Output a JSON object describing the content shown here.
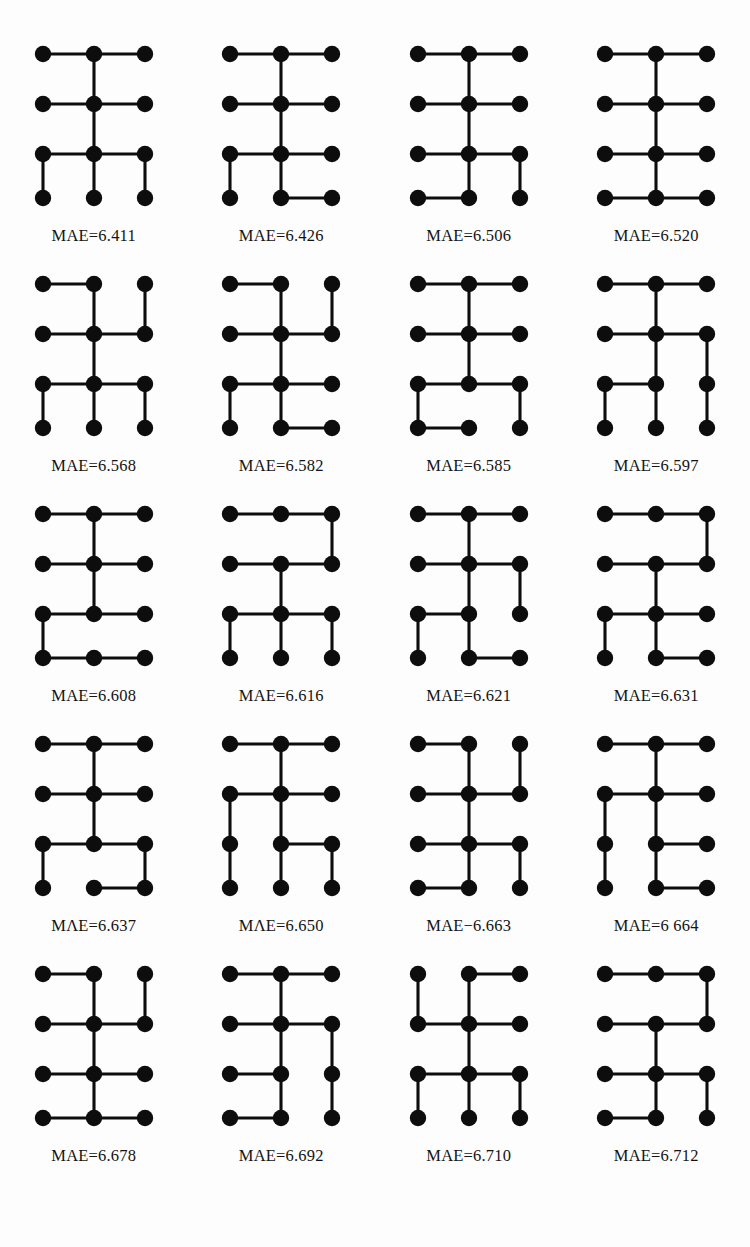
{
  "figure": {
    "node_color": "#0d0d0d",
    "edge_color": "#0d0d0d",
    "background": "#fdfdfd",
    "columns": 4,
    "rows": 5,
    "lattice": {
      "cols": 3,
      "rows": 4
    }
  },
  "graphs": [
    {
      "index": 1,
      "caption": "MAE=6.411",
      "mae": 6.411,
      "h_edges": [
        [
          1,
          1
        ],
        [
          1,
          2
        ],
        [
          2,
          1
        ],
        [
          2,
          2
        ],
        [
          3,
          1
        ],
        [
          3,
          2
        ]
      ],
      "v_edges": [
        [
          1,
          2
        ],
        [
          2,
          2
        ],
        [
          3,
          1
        ],
        [
          3,
          2
        ],
        [
          3,
          3
        ]
      ]
    },
    {
      "index": 2,
      "caption": "MAE=6.426",
      "mae": 6.426,
      "h_edges": [
        [
          1,
          1
        ],
        [
          1,
          2
        ],
        [
          2,
          1
        ],
        [
          2,
          2
        ],
        [
          3,
          1
        ],
        [
          3,
          2
        ],
        [
          4,
          2
        ]
      ],
      "v_edges": [
        [
          1,
          2
        ],
        [
          2,
          2
        ],
        [
          3,
          1
        ],
        [
          3,
          2
        ]
      ]
    },
    {
      "index": 3,
      "caption": "MAE=6.506",
      "mae": 6.506,
      "h_edges": [
        [
          1,
          1
        ],
        [
          1,
          2
        ],
        [
          2,
          1
        ],
        [
          2,
          2
        ],
        [
          3,
          1
        ],
        [
          3,
          2
        ],
        [
          4,
          1
        ]
      ],
      "v_edges": [
        [
          1,
          2
        ],
        [
          2,
          2
        ],
        [
          3,
          2
        ],
        [
          3,
          3
        ]
      ]
    },
    {
      "index": 4,
      "caption": "MAE=6.520",
      "mae": 6.52,
      "h_edges": [
        [
          1,
          1
        ],
        [
          1,
          2
        ],
        [
          2,
          1
        ],
        [
          2,
          2
        ],
        [
          3,
          1
        ],
        [
          3,
          2
        ],
        [
          4,
          1
        ],
        [
          4,
          2
        ]
      ],
      "v_edges": [
        [
          1,
          2
        ],
        [
          2,
          2
        ],
        [
          3,
          2
        ]
      ]
    },
    {
      "index": 5,
      "caption": "MAE=6.568",
      "mae": 6.568,
      "h_edges": [
        [
          1,
          1
        ],
        [
          2,
          1
        ],
        [
          2,
          2
        ],
        [
          3,
          1
        ],
        [
          3,
          2
        ]
      ],
      "v_edges": [
        [
          1,
          2
        ],
        [
          1,
          3
        ],
        [
          2,
          2
        ],
        [
          3,
          1
        ],
        [
          3,
          2
        ],
        [
          3,
          3
        ]
      ]
    },
    {
      "index": 6,
      "caption": "MAE=6.582",
      "mae": 6.582,
      "h_edges": [
        [
          1,
          1
        ],
        [
          2,
          1
        ],
        [
          2,
          2
        ],
        [
          3,
          1
        ],
        [
          3,
          2
        ],
        [
          4,
          2
        ]
      ],
      "v_edges": [
        [
          1,
          2
        ],
        [
          1,
          3
        ],
        [
          2,
          2
        ],
        [
          3,
          1
        ],
        [
          3,
          2
        ]
      ]
    },
    {
      "index": 7,
      "caption": "MAE=6.585",
      "mae": 6.585,
      "h_edges": [
        [
          1,
          1
        ],
        [
          1,
          2
        ],
        [
          2,
          1
        ],
        [
          2,
          2
        ],
        [
          3,
          1
        ],
        [
          3,
          2
        ],
        [
          4,
          1
        ]
      ],
      "v_edges": [
        [
          1,
          2
        ],
        [
          2,
          2
        ],
        [
          3,
          1
        ],
        [
          3,
          3
        ]
      ]
    },
    {
      "index": 8,
      "caption": "MAE=6.597",
      "mae": 6.597,
      "h_edges": [
        [
          1,
          1
        ],
        [
          1,
          2
        ],
        [
          2,
          1
        ],
        [
          2,
          2
        ],
        [
          3,
          1
        ]
      ],
      "v_edges": [
        [
          1,
          2
        ],
        [
          2,
          2
        ],
        [
          2,
          3
        ],
        [
          3,
          1
        ],
        [
          3,
          2
        ],
        [
          3,
          3
        ]
      ]
    },
    {
      "index": 9,
      "caption": "MAE=6.608",
      "mae": 6.608,
      "h_edges": [
        [
          1,
          1
        ],
        [
          1,
          2
        ],
        [
          2,
          1
        ],
        [
          2,
          2
        ],
        [
          3,
          1
        ],
        [
          3,
          2
        ],
        [
          4,
          1
        ],
        [
          4,
          2
        ]
      ],
      "v_edges": [
        [
          1,
          2
        ],
        [
          2,
          2
        ],
        [
          3,
          1
        ]
      ]
    },
    {
      "index": 10,
      "caption": "MAE=6.616",
      "mae": 6.616,
      "h_edges": [
        [
          1,
          1
        ],
        [
          1,
          2
        ],
        [
          2,
          1
        ],
        [
          2,
          2
        ],
        [
          3,
          1
        ],
        [
          3,
          2
        ]
      ],
      "v_edges": [
        [
          1,
          3
        ],
        [
          2,
          2
        ],
        [
          3,
          1
        ],
        [
          3,
          2
        ],
        [
          3,
          3
        ]
      ]
    },
    {
      "index": 11,
      "caption": "MAE=6.621",
      "mae": 6.621,
      "h_edges": [
        [
          1,
          1
        ],
        [
          1,
          2
        ],
        [
          2,
          1
        ],
        [
          2,
          2
        ],
        [
          3,
          1
        ],
        [
          4,
          2
        ]
      ],
      "v_edges": [
        [
          1,
          2
        ],
        [
          2,
          2
        ],
        [
          2,
          3
        ],
        [
          3,
          1
        ],
        [
          3,
          2
        ]
      ]
    },
    {
      "index": 12,
      "caption": "MAE=6.631",
      "mae": 6.631,
      "h_edges": [
        [
          1,
          1
        ],
        [
          1,
          2
        ],
        [
          2,
          1
        ],
        [
          2,
          2
        ],
        [
          3,
          1
        ],
        [
          3,
          2
        ],
        [
          4,
          2
        ]
      ],
      "v_edges": [
        [
          1,
          3
        ],
        [
          2,
          2
        ],
        [
          3,
          1
        ],
        [
          3,
          2
        ]
      ]
    },
    {
      "index": 13,
      "caption": "MΛE=6.637",
      "mae": 6.637,
      "h_edges": [
        [
          1,
          1
        ],
        [
          1,
          2
        ],
        [
          2,
          1
        ],
        [
          2,
          2
        ],
        [
          3,
          1
        ],
        [
          3,
          2
        ],
        [
          4,
          2
        ]
      ],
      "v_edges": [
        [
          1,
          2
        ],
        [
          2,
          2
        ],
        [
          3,
          1
        ],
        [
          3,
          3
        ]
      ]
    },
    {
      "index": 14,
      "caption": "MΛE=6.650",
      "mae": 6.65,
      "h_edges": [
        [
          1,
          1
        ],
        [
          1,
          2
        ],
        [
          2,
          1
        ],
        [
          2,
          2
        ],
        [
          3,
          2
        ]
      ],
      "v_edges": [
        [
          1,
          2
        ],
        [
          2,
          1
        ],
        [
          2,
          2
        ],
        [
          3,
          1
        ],
        [
          3,
          2
        ],
        [
          3,
          3
        ]
      ]
    },
    {
      "index": 15,
      "caption": "MAE−6.663",
      "mae": 6.663,
      "h_edges": [
        [
          1,
          1
        ],
        [
          2,
          1
        ],
        [
          2,
          2
        ],
        [
          3,
          1
        ],
        [
          3,
          2
        ],
        [
          4,
          1
        ]
      ],
      "v_edges": [
        [
          1,
          2
        ],
        [
          1,
          3
        ],
        [
          2,
          2
        ],
        [
          3,
          2
        ],
        [
          3,
          3
        ]
      ]
    },
    {
      "index": 16,
      "caption": "MAE=6 664",
      "mae": 6.664,
      "h_edges": [
        [
          1,
          1
        ],
        [
          1,
          2
        ],
        [
          2,
          1
        ],
        [
          2,
          2
        ],
        [
          3,
          2
        ],
        [
          4,
          2
        ]
      ],
      "v_edges": [
        [
          1,
          2
        ],
        [
          2,
          1
        ],
        [
          2,
          2
        ],
        [
          3,
          1
        ],
        [
          3,
          2
        ]
      ]
    },
    {
      "index": 17,
      "caption": "MAE=6.678",
      "mae": 6.678,
      "h_edges": [
        [
          1,
          1
        ],
        [
          2,
          1
        ],
        [
          2,
          2
        ],
        [
          3,
          1
        ],
        [
          3,
          2
        ],
        [
          4,
          1
        ],
        [
          4,
          2
        ]
      ],
      "v_edges": [
        [
          1,
          2
        ],
        [
          1,
          3
        ],
        [
          2,
          2
        ],
        [
          3,
          2
        ]
      ]
    },
    {
      "index": 18,
      "caption": "MAE=6.692",
      "mae": 6.692,
      "h_edges": [
        [
          1,
          1
        ],
        [
          1,
          2
        ],
        [
          2,
          1
        ],
        [
          2,
          2
        ],
        [
          3,
          1
        ],
        [
          4,
          1
        ]
      ],
      "v_edges": [
        [
          1,
          2
        ],
        [
          2,
          2
        ],
        [
          2,
          3
        ],
        [
          3,
          2
        ],
        [
          3,
          3
        ]
      ]
    },
    {
      "index": 19,
      "caption": "MAE=6.710",
      "mae": 6.71,
      "h_edges": [
        [
          1,
          2
        ],
        [
          2,
          1
        ],
        [
          2,
          2
        ],
        [
          3,
          1
        ],
        [
          3,
          2
        ]
      ],
      "v_edges": [
        [
          1,
          1
        ],
        [
          1,
          2
        ],
        [
          2,
          2
        ],
        [
          3,
          1
        ],
        [
          3,
          2
        ],
        [
          3,
          3
        ]
      ]
    },
    {
      "index": 20,
      "caption": "MAE=6.712",
      "mae": 6.712,
      "h_edges": [
        [
          1,
          1
        ],
        [
          1,
          2
        ],
        [
          2,
          1
        ],
        [
          2,
          2
        ],
        [
          3,
          1
        ],
        [
          3,
          2
        ],
        [
          4,
          1
        ]
      ],
      "v_edges": [
        [
          1,
          3
        ],
        [
          2,
          2
        ],
        [
          3,
          2
        ],
        [
          3,
          3
        ]
      ]
    }
  ]
}
